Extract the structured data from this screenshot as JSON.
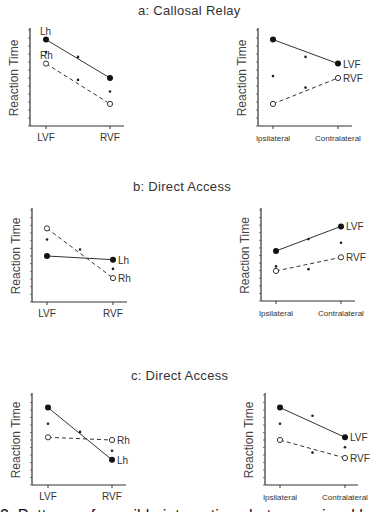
{
  "panels": [
    {
      "title": "a:  Callosal Relay",
      "title_x": 138,
      "title_y": 3
    },
    {
      "title": "b:  Direct Access",
      "title_x": 133,
      "title_y": 179
    },
    {
      "title": "c:  Direct Access",
      "title_x": 131,
      "title_y": 368
    }
  ],
  "ylabel": "Reaction Time",
  "caption_partial": "2. Patterns of possible interactions between visual hemifields, facing the",
  "chart_data": [
    {
      "type": "line",
      "panel": "a",
      "side": "left",
      "title": "a: Callosal Relay",
      "xlabel": "",
      "ylabel": "Reaction Time",
      "categories": [
        "LVF",
        "RVF"
      ],
      "series": [
        {
          "name": "Lh",
          "marker": "filled",
          "style": "solid",
          "values": [
            9,
            5
          ]
        },
        {
          "name": "Rh",
          "marker": "open",
          "style": "dashed",
          "values": [
            6.5,
            2.3
          ]
        }
      ],
      "asterisks": [
        [
          0,
          7.7
        ],
        [
          0.5,
          7.2
        ],
        [
          0.5,
          4.8
        ],
        [
          1,
          3.6
        ]
      ]
    },
    {
      "type": "line",
      "panel": "a",
      "side": "right",
      "ylabel": "Reaction Time",
      "categories": [
        "Ipsilateral",
        "Contralateral"
      ],
      "series": [
        {
          "name": "LVF",
          "marker": "filled",
          "style": "solid",
          "values": [
            9,
            6.5
          ]
        },
        {
          "name": "RVF",
          "marker": "open",
          "style": "dashed",
          "values": [
            2.3,
            5
          ]
        }
      ],
      "asterisks": [
        [
          0,
          5.2
        ],
        [
          0.5,
          7.2
        ],
        [
          0.5,
          4
        ]
      ]
    },
    {
      "type": "line",
      "panel": "b",
      "side": "left",
      "title": "b: Direct Access",
      "ylabel": "Reaction Time",
      "categories": [
        "LVF",
        "RVF"
      ],
      "series": [
        {
          "name": "Lh",
          "marker": "filled",
          "style": "solid",
          "values": [
            5,
            4.6
          ]
        },
        {
          "name": "Rh",
          "marker": "open",
          "style": "dashed",
          "values": [
            8,
            2.6
          ]
        }
      ],
      "asterisks": [
        [
          0,
          6.8
        ],
        [
          0.5,
          5.7
        ],
        [
          1,
          3.6
        ]
      ]
    },
    {
      "type": "line",
      "panel": "b",
      "side": "right",
      "ylabel": "Reaction Time",
      "categories": [
        "Ipsilateral",
        "Contralateral"
      ],
      "series": [
        {
          "name": "LVF",
          "marker": "filled",
          "style": "solid",
          "values": [
            5.5,
            8.2
          ]
        },
        {
          "name": "RVF",
          "marker": "open",
          "style": "dashed",
          "values": [
            3.3,
            4.8
          ]
        }
      ],
      "asterisks": [
        [
          0,
          3.8
        ],
        [
          0.5,
          6.8
        ],
        [
          0.5,
          3.5
        ],
        [
          1,
          6.4
        ]
      ]
    },
    {
      "type": "line",
      "panel": "c",
      "side": "left",
      "title": "c: Direct Access",
      "ylabel": "Reaction Time",
      "categories": [
        "LVF",
        "RVF"
      ],
      "series": [
        {
          "name": "Lh",
          "marker": "filled",
          "style": "solid",
          "values": [
            8.6,
            2.8
          ]
        },
        {
          "name": "Rh",
          "marker": "open",
          "style": "dashed",
          "values": [
            5.3,
            5
          ]
        }
      ],
      "asterisks": [
        [
          0,
          6.8
        ],
        [
          0.5,
          5.9
        ],
        [
          1,
          3.8
        ]
      ]
    },
    {
      "type": "line",
      "panel": "c",
      "side": "right",
      "ylabel": "Reaction Time",
      "categories": [
        "Ipsilateral",
        "Contralateral"
      ],
      "series": [
        {
          "name": "LVF",
          "marker": "filled",
          "style": "solid",
          "values": [
            8.6,
            5.3
          ]
        },
        {
          "name": "RVF",
          "marker": "open",
          "style": "dashed",
          "values": [
            5,
            3
          ]
        }
      ],
      "asterisks": [
        [
          0,
          6.8
        ],
        [
          0.5,
          7.7
        ],
        [
          0.5,
          3.6
        ],
        [
          1,
          4.2
        ]
      ]
    }
  ]
}
